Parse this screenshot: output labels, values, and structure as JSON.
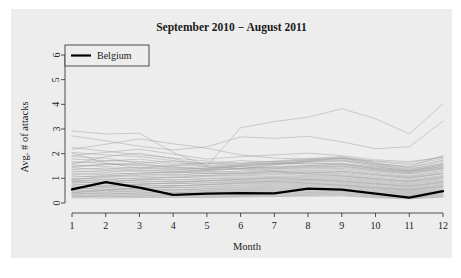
{
  "chart_data": {
    "type": "line",
    "title": "September 2010 − August 2011",
    "xlabel": "Month",
    "ylabel": "Avg. # of attacks",
    "x": [
      1,
      2,
      3,
      4,
      5,
      6,
      7,
      8,
      9,
      10,
      11,
      12
    ],
    "xtick_labels": [
      "1",
      "2",
      "3",
      "4",
      "5",
      "6",
      "7",
      "8",
      "9",
      "10",
      "11",
      "12"
    ],
    "ytick_labels": [
      "0",
      "1",
      "2",
      "3",
      "4",
      "5",
      "6"
    ],
    "yticks": [
      0,
      1,
      2,
      3,
      4,
      5,
      6
    ],
    "xlim": [
      1,
      12
    ],
    "ylim": [
      0,
      6
    ],
    "grid": false,
    "legend_position": "top-left",
    "legend": [
      "Belgium"
    ],
    "highlight_color": "#000000",
    "background_series_color": "#9a9a9a",
    "panel_color": "#ededed",
    "highlight_series": {
      "name": "Belgium",
      "values": [
        0.55,
        0.85,
        0.62,
        0.33,
        0.38,
        0.4,
        0.39,
        0.58,
        0.54,
        0.38,
        0.22,
        0.48
      ]
    },
    "series": [
      {
        "name": "country-01",
        "values": [
          2.92,
          2.8,
          2.83,
          2.05,
          1.5,
          3.05,
          3.3,
          3.48,
          3.82,
          3.42,
          2.8,
          4.02
        ]
      },
      {
        "name": "country-02",
        "values": [
          2.72,
          2.52,
          2.3,
          2.15,
          2.28,
          2.68,
          2.62,
          2.7,
          2.48,
          2.2,
          2.28,
          3.32
        ]
      },
      {
        "name": "country-03",
        "values": [
          2.18,
          2.38,
          2.6,
          2.4,
          2.22,
          1.95,
          1.82,
          1.78,
          1.85,
          1.7,
          1.62,
          1.88
        ]
      },
      {
        "name": "country-04",
        "values": [
          2.05,
          1.95,
          1.88,
          1.72,
          1.45,
          1.38,
          1.55,
          1.7,
          1.82,
          1.6,
          1.48,
          1.92
        ]
      },
      {
        "name": "country-05",
        "values": [
          1.62,
          1.7,
          1.78,
          1.62,
          1.58,
          1.72,
          1.66,
          1.74,
          1.8,
          1.58,
          1.42,
          1.7
        ]
      },
      {
        "name": "country-06",
        "values": [
          1.55,
          1.48,
          1.4,
          1.52,
          1.62,
          1.58,
          1.6,
          1.68,
          1.72,
          1.55,
          1.38,
          1.62
        ]
      },
      {
        "name": "country-07",
        "values": [
          1.48,
          1.58,
          1.52,
          1.42,
          1.36,
          1.48,
          1.55,
          1.62,
          1.58,
          1.46,
          1.32,
          1.55
        ]
      },
      {
        "name": "country-08",
        "values": [
          1.42,
          1.36,
          1.45,
          1.38,
          1.3,
          1.42,
          1.48,
          1.52,
          1.55,
          1.4,
          1.28,
          1.48
        ]
      },
      {
        "name": "country-09",
        "values": [
          1.35,
          1.42,
          1.32,
          1.28,
          1.35,
          1.38,
          1.42,
          1.48,
          1.5,
          1.35,
          1.22,
          1.42
        ]
      },
      {
        "name": "country-10",
        "values": [
          1.3,
          1.25,
          1.35,
          1.3,
          1.22,
          1.3,
          1.38,
          1.42,
          1.45,
          1.3,
          1.18,
          1.38
        ]
      },
      {
        "name": "country-11",
        "values": [
          1.25,
          1.32,
          1.28,
          1.2,
          1.28,
          1.25,
          1.32,
          1.38,
          1.4,
          1.25,
          1.12,
          1.32
        ]
      },
      {
        "name": "country-12",
        "values": [
          1.2,
          1.15,
          1.22,
          1.25,
          1.18,
          1.22,
          1.28,
          1.32,
          1.35,
          1.2,
          1.08,
          1.28
        ]
      },
      {
        "name": "country-13",
        "values": [
          1.15,
          1.22,
          1.18,
          1.12,
          1.2,
          1.18,
          1.22,
          1.28,
          1.3,
          1.15,
          1.05,
          1.22
        ]
      },
      {
        "name": "country-14",
        "values": [
          1.1,
          1.05,
          1.12,
          1.15,
          1.1,
          1.14,
          1.18,
          1.22,
          1.25,
          1.1,
          1.0,
          1.18
        ]
      },
      {
        "name": "country-15",
        "values": [
          1.05,
          1.12,
          1.08,
          1.02,
          1.08,
          1.1,
          1.14,
          1.18,
          1.2,
          1.05,
          0.95,
          1.12
        ]
      },
      {
        "name": "country-16",
        "values": [
          1.0,
          0.95,
          1.02,
          1.05,
          1.0,
          1.05,
          1.08,
          1.12,
          1.15,
          1.0,
          0.9,
          1.08
        ]
      },
      {
        "name": "country-17",
        "values": [
          0.96,
          1.02,
          0.98,
          0.92,
          0.98,
          1.0,
          1.04,
          1.08,
          1.1,
          0.96,
          0.86,
          1.02
        ]
      },
      {
        "name": "country-18",
        "values": [
          0.92,
          0.88,
          0.94,
          0.96,
          0.92,
          0.96,
          1.0,
          1.04,
          1.06,
          0.92,
          0.82,
          0.98
        ]
      },
      {
        "name": "country-19",
        "values": [
          0.88,
          0.94,
          0.9,
          0.85,
          0.9,
          0.92,
          0.95,
          0.99,
          1.02,
          0.88,
          0.78,
          0.94
        ]
      },
      {
        "name": "country-20",
        "values": [
          0.84,
          0.8,
          0.86,
          0.88,
          0.84,
          0.88,
          0.92,
          0.95,
          0.98,
          0.84,
          0.74,
          0.9
        ]
      },
      {
        "name": "country-21",
        "values": [
          0.8,
          0.86,
          0.82,
          0.78,
          0.82,
          0.85,
          0.88,
          0.92,
          0.94,
          0.8,
          0.7,
          0.86
        ]
      },
      {
        "name": "country-22",
        "values": [
          0.76,
          0.72,
          0.78,
          0.8,
          0.76,
          0.8,
          0.84,
          0.88,
          0.9,
          0.76,
          0.66,
          0.82
        ]
      },
      {
        "name": "country-23",
        "values": [
          0.72,
          0.78,
          0.74,
          0.7,
          0.74,
          0.77,
          0.8,
          0.84,
          0.86,
          0.72,
          0.62,
          0.78
        ]
      },
      {
        "name": "country-24",
        "values": [
          0.68,
          0.64,
          0.7,
          0.72,
          0.68,
          0.72,
          0.76,
          0.8,
          0.82,
          0.68,
          0.58,
          0.74
        ]
      },
      {
        "name": "country-25",
        "values": [
          0.64,
          0.7,
          0.66,
          0.62,
          0.66,
          0.69,
          0.72,
          0.76,
          0.78,
          0.64,
          0.55,
          0.7
        ]
      },
      {
        "name": "country-26",
        "values": [
          0.6,
          0.56,
          0.62,
          0.64,
          0.6,
          0.64,
          0.68,
          0.72,
          0.74,
          0.6,
          0.52,
          0.66
        ]
      },
      {
        "name": "country-27",
        "values": [
          0.57,
          0.62,
          0.58,
          0.54,
          0.58,
          0.61,
          0.64,
          0.68,
          0.7,
          0.57,
          0.48,
          0.62
        ]
      },
      {
        "name": "country-28",
        "values": [
          0.53,
          0.5,
          0.55,
          0.57,
          0.53,
          0.57,
          0.6,
          0.64,
          0.66,
          0.53,
          0.45,
          0.58
        ]
      },
      {
        "name": "country-29",
        "values": [
          0.5,
          0.55,
          0.51,
          0.48,
          0.51,
          0.54,
          0.57,
          0.6,
          0.62,
          0.5,
          0.42,
          0.55
        ]
      },
      {
        "name": "country-30",
        "values": [
          0.46,
          0.43,
          0.48,
          0.5,
          0.47,
          0.5,
          0.53,
          0.56,
          0.58,
          0.46,
          0.39,
          0.51
        ]
      },
      {
        "name": "country-31",
        "values": [
          0.43,
          0.48,
          0.44,
          0.42,
          0.44,
          0.47,
          0.5,
          0.53,
          0.54,
          0.43,
          0.36,
          0.48
        ]
      },
      {
        "name": "country-32",
        "values": [
          0.4,
          0.37,
          0.41,
          0.43,
          0.4,
          0.44,
          0.46,
          0.49,
          0.5,
          0.4,
          0.33,
          0.44
        ]
      },
      {
        "name": "country-33",
        "values": [
          0.36,
          0.41,
          0.38,
          0.35,
          0.38,
          0.4,
          0.43,
          0.45,
          0.47,
          0.36,
          0.3,
          0.41
        ]
      },
      {
        "name": "country-34",
        "values": [
          0.33,
          0.31,
          0.35,
          0.36,
          0.34,
          0.37,
          0.39,
          0.42,
          0.43,
          0.33,
          0.27,
          0.37
        ]
      },
      {
        "name": "country-35",
        "values": [
          0.3,
          0.34,
          0.31,
          0.29,
          0.31,
          0.33,
          0.36,
          0.38,
          0.39,
          0.3,
          0.24,
          0.34
        ]
      },
      {
        "name": "country-36",
        "values": [
          0.27,
          0.25,
          0.28,
          0.3,
          0.28,
          0.3,
          0.32,
          0.35,
          0.36,
          0.27,
          0.22,
          0.3
        ]
      },
      {
        "name": "country-37",
        "values": [
          0.24,
          0.28,
          0.25,
          0.23,
          0.25,
          0.27,
          0.29,
          0.31,
          0.32,
          0.24,
          0.19,
          0.27
        ]
      },
      {
        "name": "country-38",
        "values": [
          0.21,
          0.2,
          0.22,
          0.24,
          0.22,
          0.24,
          0.26,
          0.28,
          0.29,
          0.21,
          0.17,
          0.24
        ]
      },
      {
        "name": "country-39",
        "values": [
          1.68,
          1.6,
          1.55,
          1.48,
          1.4,
          1.52,
          1.62,
          1.7,
          1.76,
          1.52,
          1.35,
          1.6
        ]
      },
      {
        "name": "country-40",
        "values": [
          1.78,
          1.72,
          1.68,
          1.55,
          1.48,
          1.6,
          1.7,
          1.8,
          1.88,
          1.62,
          1.45,
          1.74
        ]
      },
      {
        "name": "country-41",
        "values": [
          1.88,
          1.82,
          1.6,
          1.45,
          1.38,
          1.5,
          1.58,
          1.65,
          1.7,
          1.48,
          1.3,
          1.55
        ]
      },
      {
        "name": "country-42",
        "values": [
          2.02,
          1.62,
          1.42,
          1.35,
          1.42,
          1.55,
          1.62,
          1.58,
          1.62,
          1.42,
          1.28,
          1.5
        ]
      },
      {
        "name": "country-43",
        "values": [
          1.58,
          1.88,
          2.02,
          1.8,
          1.52,
          1.4,
          1.45,
          1.52,
          1.58,
          1.38,
          1.25,
          1.45
        ]
      },
      {
        "name": "country-44",
        "values": [
          1.45,
          1.55,
          1.62,
          1.7,
          1.62,
          1.48,
          1.4,
          1.45,
          1.5,
          1.32,
          1.2,
          1.4
        ]
      },
      {
        "name": "country-45",
        "values": [
          0.95,
          1.08,
          1.18,
          1.25,
          1.32,
          1.38,
          1.3,
          1.22,
          1.28,
          1.15,
          1.02,
          1.2
        ]
      },
      {
        "name": "country-46",
        "values": [
          0.88,
          0.82,
          0.95,
          1.05,
          1.12,
          1.2,
          1.26,
          1.18,
          1.1,
          0.98,
          0.88,
          1.05
        ]
      },
      {
        "name": "country-47",
        "values": [
          2.25,
          2.1,
          1.95,
          1.82,
          1.7,
          1.62,
          1.68,
          1.75,
          1.82,
          1.68,
          1.55,
          1.8
        ]
      },
      {
        "name": "country-48",
        "values": [
          0.62,
          0.68,
          0.75,
          0.82,
          0.9,
          0.96,
          1.02,
          0.95,
          0.88,
          0.78,
          0.68,
          0.85
        ]
      },
      {
        "name": "country-49",
        "values": [
          1.92,
          2.05,
          2.18,
          1.98,
          1.78,
          1.88,
          1.95,
          2.02,
          1.92,
          1.75,
          1.68,
          1.85
        ]
      },
      {
        "name": "country-50",
        "values": [
          0.42,
          0.52,
          0.6,
          0.68,
          0.75,
          0.82,
          0.88,
          0.8,
          0.72,
          0.62,
          0.52,
          0.68
        ]
      }
    ]
  }
}
